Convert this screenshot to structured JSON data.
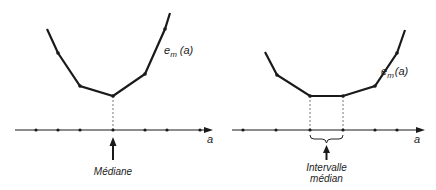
{
  "figures": [
    {
      "id": "left",
      "curve_label": "e",
      "curve_label_sub": "m",
      "curve_label_arg": "(a)",
      "axis_label": "a",
      "annotation": "Médiane",
      "curve_points": [
        [
          47,
          29
        ],
        [
          58,
          53
        ],
        [
          80,
          86
        ],
        [
          113,
          96
        ],
        [
          145,
          74
        ],
        [
          165,
          29
        ],
        [
          170,
          13
        ]
      ],
      "vertex_points": [
        [
          58,
          53
        ],
        [
          80,
          86
        ],
        [
          113,
          96
        ],
        [
          145,
          74
        ],
        [
          165,
          29
        ]
      ],
      "axis": {
        "x1": 15,
        "x2": 213,
        "y": 130
      },
      "axis_dots": [
        36,
        58,
        80,
        113,
        145,
        167,
        200
      ],
      "dashed_x": [
        113
      ]
    },
    {
      "id": "right",
      "curve_label": "e",
      "curve_label_sub": "m",
      "curve_label_arg": "(a)",
      "axis_label": "a",
      "annotation_line1": "Intervalle",
      "annotation_line2": "médian",
      "curve_points": [
        [
          265,
          52
        ],
        [
          277,
          75
        ],
        [
          310,
          96
        ],
        [
          343,
          96
        ],
        [
          375,
          86
        ],
        [
          397,
          53
        ],
        [
          405,
          30
        ]
      ],
      "vertex_points": [
        [
          277,
          75
        ],
        [
          310,
          96
        ],
        [
          343,
          96
        ],
        [
          375,
          86
        ],
        [
          397,
          53
        ]
      ],
      "axis": {
        "x1": 232,
        "x2": 425,
        "y": 130
      },
      "axis_dots": [
        243,
        276,
        310,
        343,
        375,
        397
      ],
      "dashed_x": [
        310,
        343
      ]
    }
  ]
}
